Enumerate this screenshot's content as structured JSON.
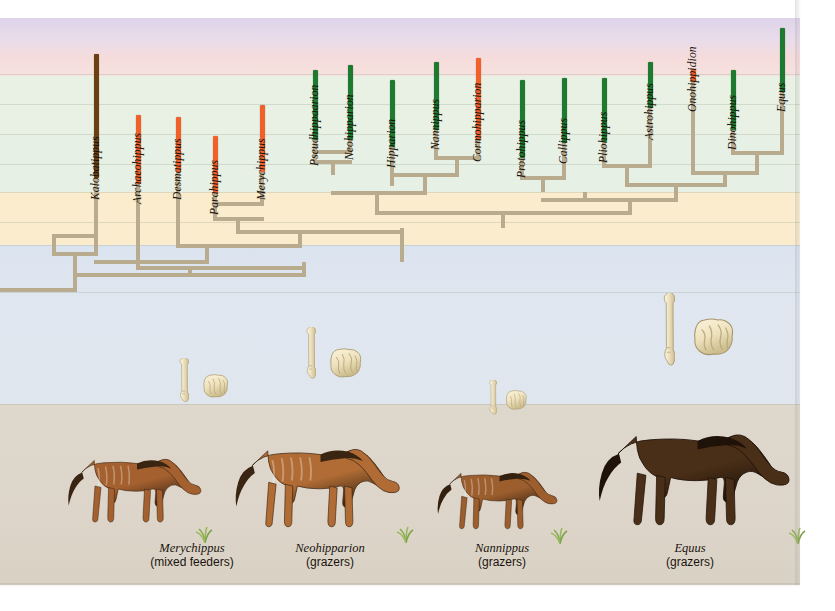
{
  "figure": {
    "right_margin_px": 800
  },
  "bands": [
    {
      "name": "upper-purple",
      "top": 18,
      "height": 26,
      "color": "#e4dcec"
    },
    {
      "name": "pink",
      "top": 44,
      "height": 30,
      "color": "#f7dedd"
    },
    {
      "name": "pale-green-upper",
      "top": 74,
      "height": 60,
      "color": "#e8f1e4"
    },
    {
      "name": "pale-green-mid",
      "top": 134,
      "height": 58,
      "color": "#e7f0e4"
    },
    {
      "name": "tan-savanna",
      "top": 192,
      "height": 53,
      "color": "#fbeccd"
    },
    {
      "name": "blue-ocean",
      "top": 245,
      "height": 159,
      "color": "#dde5ee"
    },
    {
      "name": "ground-beige",
      "top": 404,
      "height": 181,
      "color": "#ded6cb"
    }
  ],
  "gridlines": [
    74,
    104,
    134,
    164,
    192,
    222,
    245,
    292,
    404
  ],
  "legend_colors": {
    "browser_orange": "#f2602a",
    "grazer_green": "#1d7a2e",
    "browser_dark": "#6b3f10",
    "branch": "#b9ab8e"
  },
  "taxa": [
    {
      "name": "Kalobatippus",
      "x": 96,
      "bar_top": 54,
      "bar_bottom": 178,
      "color": "#6b3f10",
      "label_y": 200
    },
    {
      "name": "Archaeohippus",
      "x": 138,
      "bar_top": 115,
      "bar_bottom": 184,
      "color": "#f2602a",
      "label_y": 204
    },
    {
      "name": "Desmatippus",
      "x": 178,
      "bar_top": 117,
      "bar_bottom": 172,
      "color": "#f2602a",
      "label_y": 200
    },
    {
      "name": "Parahippus",
      "x": 215,
      "bar_top": 136,
      "bar_bottom": 193,
      "color": "#f2602a",
      "label_y": 215
    },
    {
      "name": "Merychippus",
      "x": 262,
      "bar_top": 105,
      "bar_bottom": 172,
      "color": "#f2602a",
      "label_y": 200
    },
    {
      "name": "Pseudhippaarion",
      "x": 315,
      "bar_top": 70,
      "bar_bottom": 140,
      "color": "#1d7a2e",
      "label_y": 166
    },
    {
      "name": "Neohipparion",
      "x": 350,
      "bar_top": 65,
      "bar_bottom": 140,
      "color": "#1d7a2e",
      "label_y": 160
    },
    {
      "name": "Hipparion",
      "x": 392,
      "bar_top": 80,
      "bar_bottom": 147,
      "color": "#1d7a2e",
      "label_y": 168
    },
    {
      "name": "Nannippus",
      "x": 436,
      "bar_top": 62,
      "bar_bottom": 130,
      "color": "#1d7a2e",
      "label_y": 150
    },
    {
      "name": "Cormohipparion",
      "x": 478,
      "bar_top": 58,
      "bar_bottom": 140,
      "color": "#f2602a",
      "label_y": 162
    },
    {
      "name": "Protohippus",
      "x": 522,
      "bar_top": 80,
      "bar_bottom": 158,
      "color": "#1d7a2e",
      "label_y": 178
    },
    {
      "name": "Callippus",
      "x": 564,
      "bar_top": 78,
      "bar_bottom": 143,
      "color": "#1d7a2e",
      "label_y": 164
    },
    {
      "name": "Pliohippus",
      "x": 604,
      "bar_top": 78,
      "bar_bottom": 142,
      "color": "#1d7a2e",
      "label_y": 163
    },
    {
      "name": "Astrohippus",
      "x": 650,
      "bar_top": 62,
      "bar_bottom": 108,
      "color": "#1d7a2e",
      "label_y": 140
    },
    {
      "name": "Onohippidion",
      "x": 693,
      "bar_top": 69,
      "bar_bottom": 82,
      "color": "#f2602a",
      "label_y": 112
    },
    {
      "name": "Dinohippus",
      "x": 733,
      "bar_top": 70,
      "bar_bottom": 130,
      "color": "#1d7a2e",
      "label_y": 150
    },
    {
      "name": "Equus",
      "x": 782,
      "bar_top": 28,
      "bar_bottom": 92,
      "color": "#1d7a2e",
      "label_y": 112
    }
  ],
  "branches": {
    "verticals": [
      {
        "x": 96,
        "y1": 178,
        "y2": 254
      },
      {
        "x": 54,
        "y1": 236,
        "y2": 254
      },
      {
        "x": 75,
        "y1": 254,
        "y2": 290
      },
      {
        "x": 138,
        "y1": 184,
        "y2": 268
      },
      {
        "x": 178,
        "y1": 172,
        "y2": 246
      },
      {
        "x": 215,
        "y1": 193,
        "y2": 219
      },
      {
        "x": 262,
        "y1": 172,
        "y2": 204
      },
      {
        "x": 238,
        "y1": 219,
        "y2": 232
      },
      {
        "x": 315,
        "y1": 140,
        "y2": 162
      },
      {
        "x": 350,
        "y1": 140,
        "y2": 152
      },
      {
        "x": 392,
        "y1": 147,
        "y2": 186
      },
      {
        "x": 436,
        "y1": 130,
        "y2": 158
      },
      {
        "x": 478,
        "y1": 140,
        "y2": 158
      },
      {
        "x": 457,
        "y1": 158,
        "y2": 175
      },
      {
        "x": 425,
        "y1": 175,
        "y2": 193
      },
      {
        "x": 333,
        "y1": 162,
        "y2": 175
      },
      {
        "x": 522,
        "y1": 158,
        "y2": 178
      },
      {
        "x": 564,
        "y1": 143,
        "y2": 178
      },
      {
        "x": 543,
        "y1": 178,
        "y2": 192
      },
      {
        "x": 604,
        "y1": 142,
        "y2": 166
      },
      {
        "x": 650,
        "y1": 108,
        "y2": 166
      },
      {
        "x": 627,
        "y1": 166,
        "y2": 185
      },
      {
        "x": 693,
        "y1": 82,
        "y2": 173
      },
      {
        "x": 733,
        "y1": 130,
        "y2": 153
      },
      {
        "x": 782,
        "y1": 92,
        "y2": 153
      },
      {
        "x": 757,
        "y1": 153,
        "y2": 173
      },
      {
        "x": 725,
        "y1": 173,
        "y2": 185
      },
      {
        "x": 676,
        "y1": 185,
        "y2": 200
      },
      {
        "x": 585,
        "y1": 192,
        "y2": 200
      },
      {
        "x": 630,
        "y1": 200,
        "y2": 213
      },
      {
        "x": 377,
        "y1": 193,
        "y2": 213
      },
      {
        "x": 503,
        "y1": 213,
        "y2": 228
      },
      {
        "x": 300,
        "y1": 232,
        "y2": 246
      },
      {
        "x": 207,
        "y1": 246,
        "y2": 262
      },
      {
        "x": 402,
        "y1": 228,
        "y2": 262
      },
      {
        "x": 304,
        "y1": 262,
        "y2": 275
      },
      {
        "x": 190,
        "y1": 268,
        "y2": 275
      }
    ],
    "horizontals": [
      {
        "x1": 54,
        "x2": 96,
        "y": 254
      },
      {
        "x1": 54,
        "x2": 96,
        "y": 236
      },
      {
        "x1": 0,
        "x2": 75,
        "y": 290
      },
      {
        "x1": 215,
        "x2": 262,
        "y": 219
      },
      {
        "x1": 215,
        "x2": 262,
        "y": 204
      },
      {
        "x1": 315,
        "x2": 350,
        "y": 162
      },
      {
        "x1": 315,
        "x2": 350,
        "y": 152
      },
      {
        "x1": 436,
        "x2": 478,
        "y": 158
      },
      {
        "x1": 392,
        "x2": 457,
        "y": 175
      },
      {
        "x1": 333,
        "x2": 425,
        "y": 193
      },
      {
        "x1": 522,
        "x2": 564,
        "y": 178
      },
      {
        "x1": 604,
        "x2": 650,
        "y": 166
      },
      {
        "x1": 733,
        "x2": 782,
        "y": 153
      },
      {
        "x1": 693,
        "x2": 757,
        "y": 173
      },
      {
        "x1": 627,
        "x2": 725,
        "y": 185
      },
      {
        "x1": 543,
        "x2": 676,
        "y": 200
      },
      {
        "x1": 377,
        "x2": 630,
        "y": 213
      },
      {
        "x1": 238,
        "x2": 402,
        "y": 232
      },
      {
        "x1": 178,
        "x2": 300,
        "y": 246
      },
      {
        "x1": 138,
        "x2": 304,
        "y": 268
      },
      {
        "x1": 96,
        "x2": 207,
        "y": 262
      },
      {
        "x1": 75,
        "x2": 304,
        "y": 275
      }
    ]
  },
  "fossils": [
    {
      "name": "metapodial-bone-merychippus",
      "x": 178,
      "y": 358,
      "w": 11,
      "h": 46
    },
    {
      "name": "tooth-merychippus",
      "x": 201,
      "y": 374,
      "w": 30,
      "h": 24
    },
    {
      "name": "metapodial-bone-neohipparion",
      "x": 305,
      "y": 327,
      "w": 11,
      "h": 54
    },
    {
      "name": "tooth-neohipparion",
      "x": 328,
      "y": 348,
      "w": 36,
      "h": 30
    },
    {
      "name": "metapodial-bone-nannippus",
      "x": 488,
      "y": 380,
      "w": 9,
      "h": 36
    },
    {
      "name": "tooth-nannippus",
      "x": 504,
      "y": 390,
      "w": 25,
      "h": 20
    },
    {
      "name": "metapodial-bone-equus",
      "x": 662,
      "y": 293,
      "w": 13,
      "h": 76
    },
    {
      "name": "tooth-equus",
      "x": 692,
      "y": 318,
      "w": 44,
      "h": 38
    }
  ],
  "captions": [
    {
      "species": "Merychippus",
      "diet": "(mixed feeders)",
      "center_x": 192,
      "top": 541
    },
    {
      "species": "Neohipparion",
      "center_x": 330,
      "diet": "(grazers)",
      "top": 541
    },
    {
      "species": "Nannippus",
      "center_x": 502,
      "diet": "(grazers)",
      "top": 541
    },
    {
      "species": "Equus",
      "center_x": 690,
      "diet": "(grazers)",
      "top": 541
    }
  ],
  "horses": [
    {
      "name": "merychippus-figure",
      "x": 62,
      "y": 432,
      "w": 150,
      "h": 105,
      "body": "#a5602f",
      "mane": "#3a2412",
      "scale": 0.78
    },
    {
      "name": "neohipparion-figure",
      "x": 228,
      "y": 424,
      "w": 185,
      "h": 113,
      "body": "#b06c34",
      "mane": "#3a2412",
      "scale": 0.92
    },
    {
      "name": "nannippus-figure",
      "x": 432,
      "y": 452,
      "w": 135,
      "h": 86,
      "body": "#9d5e2e",
      "mane": "#33200f",
      "scale": 0.7
    },
    {
      "name": "equus-figure",
      "x": 590,
      "y": 404,
      "w": 215,
      "h": 134,
      "body": "#4a2f18",
      "mane": "#1f1209",
      "scale": 1.08
    }
  ]
}
